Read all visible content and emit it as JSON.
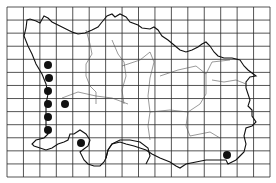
{
  "map": {
    "type": "distribution-grid-map",
    "background": "#ffffff",
    "line_color": "#1a1a1a",
    "grid": {
      "x0": 7,
      "y0": 7,
      "x1": 270,
      "y1": 177,
      "columns": 16,
      "rows": 13,
      "color": "#2a2a2a"
    },
    "records": [
      {
        "x": 48,
        "y": 65
      },
      {
        "x": 49,
        "y": 78
      },
      {
        "x": 48,
        "y": 91
      },
      {
        "x": 48,
        "y": 104
      },
      {
        "x": 65,
        "y": 104
      },
      {
        "x": 48,
        "y": 117
      },
      {
        "x": 48,
        "y": 130
      },
      {
        "x": 81,
        "y": 143
      },
      {
        "x": 227,
        "y": 155
      }
    ],
    "dot_color": "#111111",
    "dot_radius": 4
  }
}
